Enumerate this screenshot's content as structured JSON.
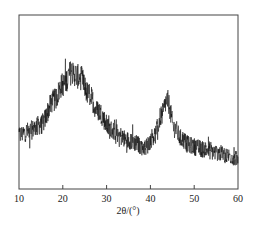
{
  "chart_data": {
    "type": "line",
    "title": "",
    "xlabel": "2θ/(°)",
    "ylabel": "",
    "xlim": [
      10,
      60
    ],
    "ylim": [
      0,
      100
    ],
    "y_units": "arbitrary intensity (no y-axis labels shown)",
    "xticks": [
      10,
      20,
      30,
      40,
      50,
      60
    ],
    "xtick_labels": [
      "10",
      "20",
      "30",
      "40",
      "50",
      "60"
    ],
    "grid": false,
    "legend": null,
    "series": [
      {
        "name": "XRD pattern",
        "color": "#111111",
        "x": [
          10,
          12,
          15,
          18,
          20,
          22,
          24,
          26,
          28,
          31,
          35,
          38.8,
          41,
          42.5,
          43.8,
          45.5,
          47,
          49,
          52,
          55,
          58,
          60
        ],
        "y": [
          31,
          33,
          37,
          51,
          60,
          67,
          64,
          54,
          45,
          34,
          28,
          24,
          31,
          42,
          51,
          35,
          29,
          25,
          23,
          21,
          19,
          17
        ],
        "noise_amplitude": 8
      }
    ],
    "annotations": [
      {
        "text": "broad peak",
        "x": 22
      },
      {
        "text": "peak",
        "x": 43.8
      }
    ]
  }
}
